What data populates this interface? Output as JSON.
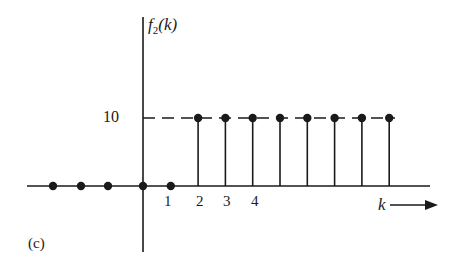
{
  "chart_data": {
    "type": "stem",
    "title": "",
    "panel_label": "(c)",
    "ylabel": "f2(k)",
    "ylabel_parts": {
      "base": "f",
      "sub": "2",
      "arg": "(k)"
    },
    "xlabel": "k",
    "x_direction_arrow": true,
    "y_ticks": [
      {
        "value": 10,
        "label": "10"
      }
    ],
    "x_ticks": [
      {
        "value": 1,
        "label": "1"
      },
      {
        "value": 2,
        "label": "2"
      },
      {
        "value": 3,
        "label": "3"
      },
      {
        "value": 4,
        "label": "4"
      }
    ],
    "x": [
      -4,
      -3,
      -2,
      0,
      1,
      2,
      3,
      4,
      5,
      6,
      7,
      8,
      9
    ],
    "values": [
      0,
      0,
      0,
      0,
      0,
      10,
      10,
      10,
      10,
      10,
      10,
      10,
      10
    ],
    "reference_line": {
      "y": 10,
      "style": "dashed"
    },
    "ylim": [
      0,
      10
    ],
    "grid": false,
    "legend": null
  },
  "labels": {
    "ylabel_base": "f",
    "ylabel_sub": "2",
    "ylabel_arg": "(k)",
    "tick_10": "10",
    "xtick_1": "1",
    "xtick_2": "2",
    "xtick_3": "3",
    "xtick_4": "4",
    "xlabel": "k",
    "caption": "(c)"
  },
  "colors": {
    "ink": "#1a1a1a",
    "background": "#ffffff"
  }
}
